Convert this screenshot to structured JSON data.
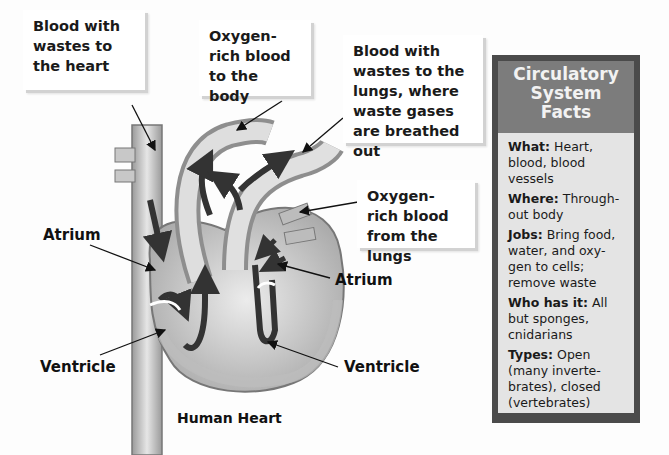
{
  "callouts": {
    "blood_wastes_heart": "Blood with wastes to the heart",
    "oxygen_rich_body": "Oxygen-rich blood to the body",
    "blood_wastes_lungs": "Blood with wastes to the lungs, where waste gases are breathed out",
    "oxygen_rich_lungs": "Oxygen-rich blood from the lungs"
  },
  "labels": {
    "atrium_left": "Atrium",
    "atrium_right": "Atrium",
    "ventricle_left": "Ventricle",
    "ventricle_right": "Ventricle"
  },
  "caption": "Human Heart",
  "facts_panel": {
    "title_lines": [
      "Circulatory",
      "System",
      "Facts"
    ],
    "items": [
      {
        "key": "What:",
        "value": "Heart, blood, blood vessels"
      },
      {
        "key": "Where:",
        "value": "Through-out body"
      },
      {
        "key": "Jobs:",
        "value": "Bring food, water, and oxy-gen to cells; remove waste"
      },
      {
        "key": "Who has it:",
        "value": "All but sponges, cnidarians"
      },
      {
        "key": "Types:",
        "value": "Open (many inverte-brates), closed (vertebrates)"
      }
    ],
    "colors": {
      "border": "#4b4b4b",
      "header": "#7c7c7c",
      "body": "#e4e4e4"
    }
  }
}
